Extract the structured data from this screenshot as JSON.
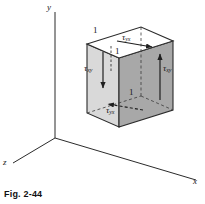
{
  "figure": {
    "caption": "Fig. 2-44",
    "axes": {
      "y_label": "y",
      "x_label": "x",
      "z_label": "z"
    },
    "element": {
      "dim_top_left": "1",
      "dim_top_inner": "1",
      "dim_front_edge": "1",
      "shear_top": {
        "symbol": "τ",
        "sub": "yx"
      },
      "shear_left": {
        "symbol": "τ",
        "sub": "xy"
      },
      "shear_right": {
        "symbol": "τ",
        "sub": "xy"
      },
      "shear_bottom": {
        "symbol": "τ",
        "sub": "yx"
      }
    },
    "colors": {
      "stroke": "#2b2b2b",
      "face_top": "#ffffff",
      "face_left": "#d9d9d9",
      "face_right": "#a8a8a8",
      "background": "#ffffff"
    }
  }
}
